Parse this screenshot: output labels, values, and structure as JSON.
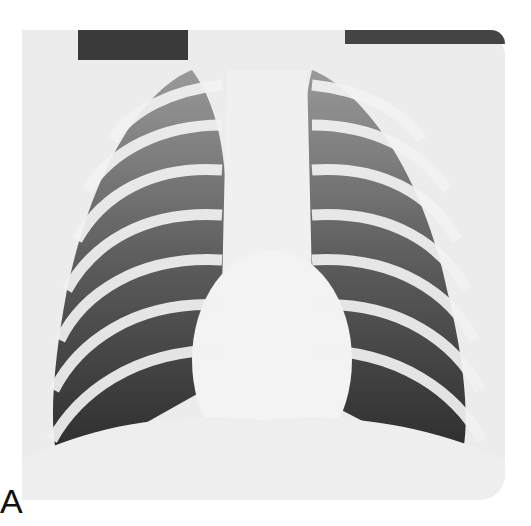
{
  "image": {
    "type": "chest radiograph",
    "view": "frontal",
    "panel_label": "A"
  },
  "colors": {
    "background": "#ffffff",
    "film": "#ececec",
    "lung_dark": "#2b2b2b",
    "rib": "#f2f2f2"
  }
}
